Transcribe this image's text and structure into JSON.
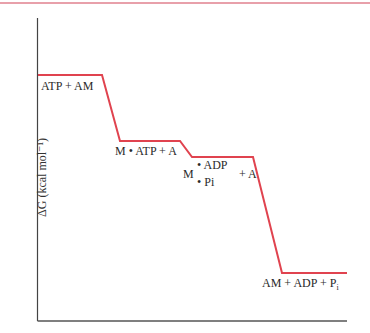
{
  "diagram": {
    "type": "free-energy-profile",
    "y_axis_label": "ΔG (kcal mol⁻¹)",
    "line_color": "#e0434f",
    "axis_color": "#333333",
    "accent_rule_color": "#e8a0aa",
    "states": [
      {
        "id": "s1",
        "label": "ATP + AM"
      },
      {
        "id": "s2",
        "label": "M • ATP + A"
      },
      {
        "id": "s3",
        "prefix": "M",
        "top": "• ADP",
        "bottom": "• Pi",
        "suffix": "+ A"
      },
      {
        "id": "s4",
        "label": "AM + ADP + P",
        "subscript": "i"
      }
    ]
  }
}
